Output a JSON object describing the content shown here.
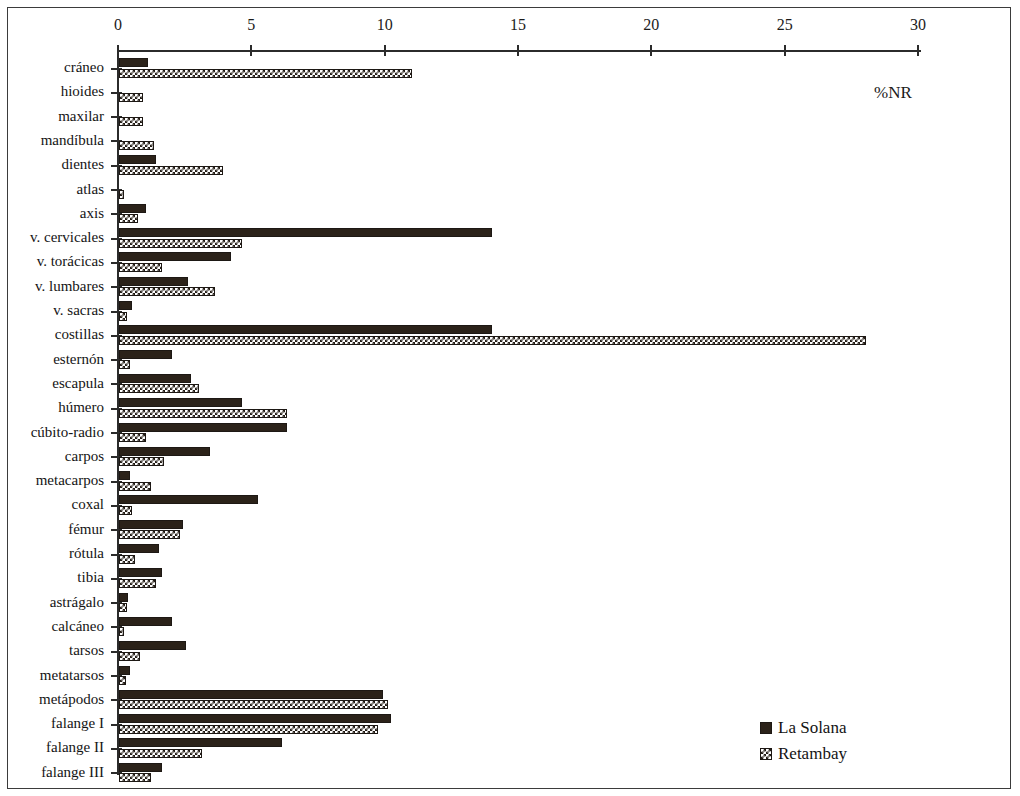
{
  "chart_data": {
    "type": "bar",
    "orientation": "horizontal",
    "title": "",
    "xlabel": "%NR",
    "ylabel": "",
    "xlim": [
      0,
      30
    ],
    "xticks": [
      0,
      5,
      10,
      15,
      20,
      25,
      30
    ],
    "grid": false,
    "legend_position": "bottom-right",
    "categories": [
      "cráneo",
      "hioides",
      "maxilar",
      "mandíbula",
      "dientes",
      "atlas",
      "axis",
      "v. cervicales",
      "v. torácicas",
      "v. lumbares",
      "v. sacras",
      "costillas",
      "esternón",
      "escapula",
      "húmero",
      "cúbito-radio",
      "carpos",
      "metacarpos",
      "coxal",
      "fémur",
      "rótula",
      "tibia",
      "astrágalo",
      "calcáneo",
      "tarsos",
      "metatarsos",
      "metápodos",
      "falange I",
      "falange II",
      "falange III"
    ],
    "series": [
      {
        "name": "La Solana",
        "color": "#2b2219",
        "pattern": "solid",
        "values": [
          1.1,
          0.0,
          0.0,
          0.0,
          1.4,
          0.0,
          1.0,
          14.0,
          4.2,
          2.6,
          0.5,
          14.0,
          2.0,
          2.7,
          4.6,
          6.3,
          3.4,
          0.4,
          5.2,
          2.4,
          1.5,
          1.6,
          0.35,
          2.0,
          2.5,
          0.4,
          9.9,
          10.2,
          6.1,
          1.6
        ]
      },
      {
        "name": "Retambay",
        "color": "#241d16",
        "pattern": "checkered",
        "values": [
          11.0,
          0.9,
          0.9,
          1.3,
          3.9,
          0.2,
          0.7,
          4.6,
          1.6,
          3.6,
          0.3,
          28.0,
          0.4,
          3.0,
          6.3,
          1.0,
          1.7,
          1.2,
          0.5,
          2.3,
          0.6,
          1.4,
          0.3,
          0.2,
          0.8,
          0.25,
          10.1,
          9.7,
          3.1,
          1.2
        ]
      }
    ]
  },
  "axis": {
    "units_label": "%NR"
  },
  "legend": {
    "entries": [
      {
        "label": "La Solana"
      },
      {
        "label": "Retambay"
      }
    ]
  }
}
